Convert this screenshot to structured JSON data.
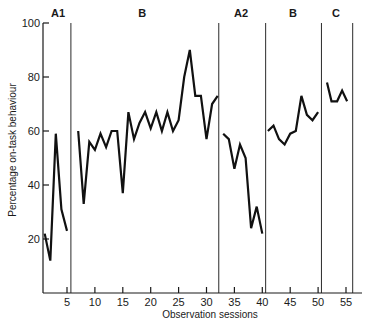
{
  "chart_data": {
    "type": "line",
    "title": "",
    "xlabel": "Observation sessions",
    "ylabel": "Percentage on-task behaviour",
    "xlim": [
      0,
      57
    ],
    "ylim": [
      0,
      100
    ],
    "x_ticks": [
      5,
      10,
      15,
      20,
      25,
      30,
      35,
      40,
      45,
      50,
      55
    ],
    "x_tick_labels": [
      "5",
      "10",
      "15",
      "20",
      "25",
      "30",
      "35",
      "40",
      "45",
      "50",
      "55"
    ],
    "y_ticks": [
      20,
      40,
      60,
      80,
      100
    ],
    "y_tick_labels": [
      "20",
      "40",
      "60",
      "80",
      "100"
    ],
    "grid": false,
    "legend": "none",
    "phase_boundaries": [
      5.7,
      32.2,
      40.6,
      50.6,
      56.2
    ],
    "phases": [
      {
        "name": "A1",
        "label_at": 3.4,
        "x": [
          1,
          2,
          3,
          4,
          5
        ],
        "values": [
          22,
          12,
          59,
          31,
          23
        ]
      },
      {
        "name": "B",
        "label_at": 18.5,
        "x": [
          7,
          8,
          9,
          10,
          11,
          12,
          13,
          14,
          15,
          16,
          17,
          18,
          19,
          20,
          21,
          22,
          23,
          24,
          25,
          26,
          27,
          28,
          29,
          30,
          31,
          32
        ],
        "values": [
          60,
          33,
          56,
          53,
          59,
          54,
          60,
          60,
          37,
          67,
          57,
          63,
          67,
          61,
          67,
          60,
          67,
          60,
          64,
          80,
          90,
          73,
          73,
          57,
          70,
          73
        ]
      },
      {
        "name": "A2",
        "label_at": 36.2,
        "x": [
          33,
          34,
          35,
          36,
          37,
          38,
          39,
          40
        ],
        "values": [
          59,
          57,
          46,
          55,
          50,
          24,
          32,
          22
        ]
      },
      {
        "name": "B",
        "label_at": 45.5,
        "x": [
          41,
          42,
          43,
          44,
          45,
          46,
          47,
          48,
          49,
          50
        ],
        "values": [
          60,
          62,
          57,
          55,
          59,
          60,
          73,
          66,
          64,
          67
        ]
      },
      {
        "name": "C",
        "label_at": 53.2,
        "x": [
          51.6,
          52.4,
          53.4,
          54.3,
          55.2
        ],
        "values": [
          78,
          71,
          71,
          75,
          71
        ]
      }
    ]
  }
}
